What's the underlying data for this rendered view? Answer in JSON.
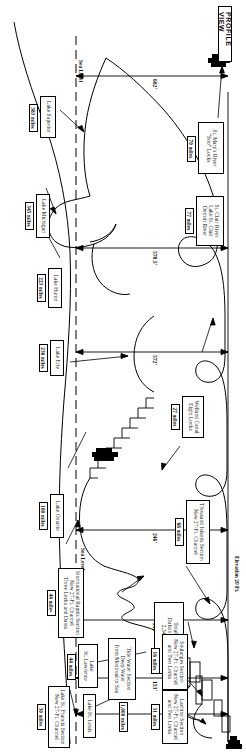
{
  "figure": {
    "title": "PROFILE VIEW",
    "sea_level_label": "Sea Level",
    "sea_level_label_2": "Sea Level",
    "elevation_label": "Elevation 20 Ft."
  },
  "summary": {
    "total_mileage": "Total Mileage\nDuluth to Atlantic\n2,342 miles"
  },
  "sections": [
    {
      "name": "lake_superior",
      "label": "Lake Superior",
      "miles": "383 miles"
    },
    {
      "name": "st-marys-river",
      "label": "St. Mary's River\n“Soo” Locks",
      "miles": "70 miles"
    },
    {
      "name": "lake_michigan",
      "label": "Lake Michigan",
      "miles": "345 miles"
    },
    {
      "name": "lake_huron",
      "label": "Lake Huron",
      "miles": "223 miles"
    },
    {
      "name": "st-clair-detroit",
      "label": "St. Clair River\nLake St. Clair\nDetroit River",
      "miles": "77 miles"
    },
    {
      "name": "lake_erie",
      "label": "Lake Erie",
      "miles": "236 miles"
    },
    {
      "name": "welland-canal",
      "label": "Welland Canal\nEight Locks",
      "miles": "27 miles"
    },
    {
      "name": "lake_ontario",
      "label": "Lake Ontario",
      "miles": "180 miles"
    },
    {
      "name": "thousand-islands",
      "label": "Thousand Islands Section\nNew 27-Ft. Channel",
      "miles": "68 miles"
    },
    {
      "name": "international-rapids",
      "label": "International Rapids Section\nNew 27-Ft. Channel\nThree Locks and Dams",
      "miles": "44 miles"
    },
    {
      "name": "lake-st-lawrence",
      "label": "Lake\nSt. Lawrence",
      "miles": "44 miles"
    },
    {
      "name": "lake-st-francis",
      "label": "Lake St. Francis Section\nNew 27-Ft. Channel",
      "miles": "30 miles"
    },
    {
      "name": "soulanges",
      "label": "Soulanges Section\nNew 27-Ft. Channel\nand Two Locks",
      "miles": "16 miles"
    },
    {
      "name": "lake-st-louis",
      "label": "Lake St. Louis",
      "miles": ""
    },
    {
      "name": "lachine",
      "label": "Lachine Section\nNew 27-Ft. Channel\nand Two Locks",
      "miles": "31 miles"
    },
    {
      "name": "tide-water",
      "label": "Tide Water Section\nDeep Water\nfrom Montreal to Sea",
      "miles": "1,000 miles"
    }
  ],
  "elevations": [
    {
      "name": "superior-to-sea",
      "value": "602'"
    },
    {
      "name": "michigan-huron",
      "value": "578.5'"
    },
    {
      "name": "erie",
      "value": "572'"
    },
    {
      "name": "ontario",
      "value": "246'"
    },
    {
      "name": "lake-st-lawrence-el",
      "value": "242'"
    },
    {
      "name": "lake-st-francis-el",
      "value": "153'"
    },
    {
      "name": "lake-st-louis-el",
      "value": "59'"
    }
  ],
  "colors": {
    "ink": "#000000",
    "paper": "#ffffff"
  }
}
